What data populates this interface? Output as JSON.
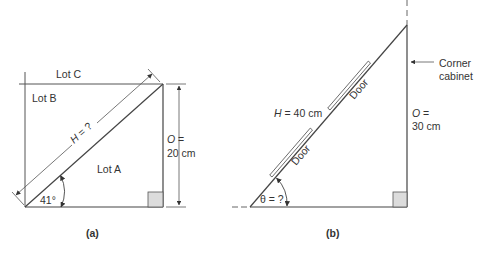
{
  "diagrams": [
    {
      "id": "a",
      "caption": "(a)",
      "labels": {
        "lot_a": "Lot A",
        "lot_b": "Lot B",
        "lot_c": "Lot C",
        "hyp_var": "H",
        "hyp_rest": " = ?",
        "opp_line1_var": "O",
        "opp_line1_rest": " =",
        "opp_line2": "20 cm",
        "angle": "41°"
      }
    },
    {
      "id": "b",
      "caption": "(b)",
      "labels": {
        "hyp_var": "H",
        "hyp_rest": " = 40 cm",
        "opp_line1_var": "O",
        "opp_line1_rest": " =",
        "opp_line2": "30 cm",
        "angle": "θ = ?",
        "door_upper": "Door",
        "door_lower": "Door",
        "callout_line1": "Corner",
        "callout_line2": "cabinet"
      }
    }
  ],
  "colors": {
    "line": "#444444",
    "right_angle_fill": "#dcdcdc",
    "text": "#333333"
  }
}
